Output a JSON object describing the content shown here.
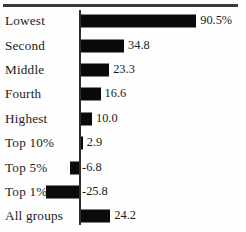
{
  "chart_data": {
    "type": "bar",
    "orientation": "horizontal",
    "title": "",
    "subtitle": "",
    "xlabel": "",
    "ylabel": "",
    "grid": false,
    "legend": null,
    "value_suffixes": [
      "%",
      "",
      "",
      "",
      "",
      "",
      "",
      "",
      ""
    ],
    "zero_baseline": true,
    "xlim": [
      -30,
      95
    ],
    "categories": [
      "Lowest",
      "Second",
      "Middle",
      "Fourth",
      "Highest",
      "Top 10%",
      "Top 5%",
      "Top 1%",
      "All groups"
    ],
    "values": [
      90.5,
      34.8,
      23.3,
      16.6,
      10.0,
      2.9,
      -6.8,
      -25.8,
      24.2
    ],
    "value_labels": [
      "90.5%",
      "34.8",
      "23.3",
      "16.6",
      "10.0",
      "2.9",
      "-6.8",
      "-25.8",
      "24.2"
    ],
    "bar_color": "#0a0a0a",
    "axis_color": "#2e2e2e",
    "rule_color": "#3a3a3a",
    "background": "#fefefe"
  }
}
